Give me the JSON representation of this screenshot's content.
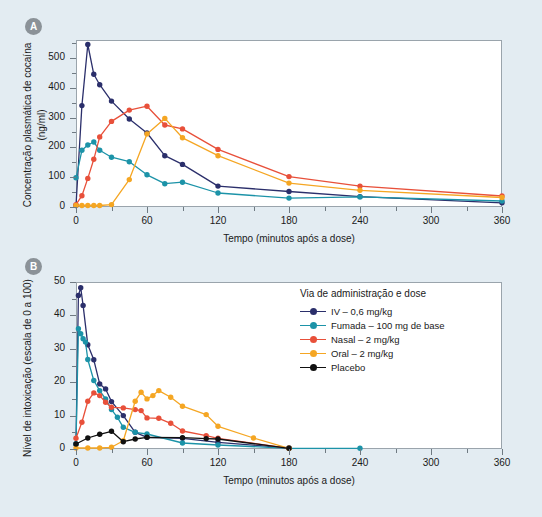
{
  "figure": {
    "background_color": "#e3ecf2"
  },
  "panels": [
    {
      "badge": "A",
      "ylabel_line1": "Concentração plasmática de cocaína",
      "ylabel_line2": "(ng/ml)",
      "xlabel": "Tempo (minutos após a dose)",
      "yticks": [
        "0",
        "100",
        "200",
        "300",
        "400",
        "500"
      ],
      "xticks": [
        "0",
        "60",
        "120",
        "180",
        "240",
        "300",
        "360"
      ]
    },
    {
      "badge": "B",
      "ylabel_line1": "Nível de intoxicação (escala de 0 a 100)",
      "ylabel_line2": "",
      "xlabel": "Tempo (minutos após a dose)",
      "yticks": [
        "0",
        "10",
        "20",
        "30",
        "40",
        "50"
      ],
      "xticks": [
        "0",
        "60",
        "120",
        "180",
        "240",
        "300",
        "360"
      ]
    }
  ],
  "legend": {
    "title": "Via de administração e dose",
    "entries": [
      {
        "label": "IV – 0,6 mg/kg",
        "color": "#2b2f6b"
      },
      {
        "label": "Fumada – 100 mg de base",
        "color": "#1c93a8"
      },
      {
        "label": "Nasal – 2 mg/kg",
        "color": "#e8503a"
      },
      {
        "label": "Oral – 2 mg/kg",
        "color": "#f5a623"
      },
      {
        "label": "Placebo",
        "color": "#111111"
      }
    ]
  },
  "colors": {
    "iv": "#2b2f6b",
    "smoked": "#1c93a8",
    "nasal": "#e8503a",
    "oral": "#f5a623",
    "placebo": "#111111",
    "background": "#e3ecf2",
    "axis": "#6f7a82",
    "plot_bg": "#ffffff"
  },
  "chart_data": [
    {
      "type": "line",
      "panel": "A",
      "title": "",
      "xlabel": "Tempo (minutos após a dose)",
      "ylabel": "Concentração plasmática de cocaína (ng/ml)",
      "xlim": [
        0,
        360
      ],
      "ylim": [
        0,
        560
      ],
      "xticks": [
        0,
        60,
        120,
        180,
        240,
        300,
        360
      ],
      "yticks": [
        0,
        100,
        200,
        300,
        400,
        500
      ],
      "grid": false,
      "legend_position": "none",
      "series": [
        {
          "name": "IV – 0,6 mg/kg",
          "color": "#2b2f6b",
          "points": [
            [
              0,
              5
            ],
            [
              5,
              340
            ],
            [
              10,
              545
            ],
            [
              15,
              445
            ],
            [
              20,
              410
            ],
            [
              30,
              355
            ],
            [
              45,
              295
            ],
            [
              60,
              248
            ],
            [
              75,
              172
            ],
            [
              90,
              143
            ],
            [
              120,
              70
            ],
            [
              180,
              52
            ],
            [
              240,
              35
            ],
            [
              360,
              14
            ]
          ]
        },
        {
          "name": "Fumada – 100 mg de base",
          "color": "#1c93a8",
          "points": [
            [
              0,
              98
            ],
            [
              5,
              190
            ],
            [
              10,
              208
            ],
            [
              15,
              218
            ],
            [
              20,
              190
            ],
            [
              30,
              167
            ],
            [
              45,
              152
            ],
            [
              60,
              108
            ],
            [
              75,
              78
            ],
            [
              90,
              83
            ],
            [
              120,
              47
            ],
            [
              180,
              30
            ],
            [
              240,
              34
            ],
            [
              360,
              20
            ]
          ]
        },
        {
          "name": "Nasal – 2 mg/kg",
          "color": "#e8503a",
          "points": [
            [
              0,
              8
            ],
            [
              5,
              38
            ],
            [
              10,
              96
            ],
            [
              15,
              160
            ],
            [
              20,
              235
            ],
            [
              30,
              287
            ],
            [
              45,
              325
            ],
            [
              60,
              338
            ],
            [
              75,
              275
            ],
            [
              90,
              262
            ],
            [
              120,
              193
            ],
            [
              180,
              102
            ],
            [
              240,
              70
            ],
            [
              360,
              37
            ]
          ]
        },
        {
          "name": "Oral – 2 mg/kg",
          "color": "#f5a623",
          "points": [
            [
              0,
              5
            ],
            [
              5,
              5
            ],
            [
              10,
              5
            ],
            [
              15,
              5
            ],
            [
              20,
              5
            ],
            [
              30,
              8
            ],
            [
              45,
              92
            ],
            [
              60,
              245
            ],
            [
              75,
              297
            ],
            [
              90,
              232
            ],
            [
              120,
              172
            ],
            [
              180,
              80
            ],
            [
              240,
              56
            ],
            [
              360,
              32
            ]
          ]
        }
      ]
    },
    {
      "type": "line",
      "panel": "B",
      "title": "",
      "xlabel": "Tempo (minutos após a dose)",
      "ylabel": "Nível de intoxicação (escala de 0 a 100)",
      "xlim": [
        0,
        360
      ],
      "ylim": [
        0,
        50
      ],
      "xticks": [
        0,
        60,
        120,
        180,
        240,
        300,
        360
      ],
      "yticks": [
        0,
        10,
        20,
        30,
        40,
        50
      ],
      "grid": false,
      "legend_position": "upper-right",
      "series": [
        {
          "name": "IV – 0,6 mg/kg",
          "color": "#2b2f6b",
          "points": [
            [
              0,
              1.5
            ],
            [
              2,
              46
            ],
            [
              4,
              48.3
            ],
            [
              6,
              43
            ],
            [
              10,
              31.2
            ],
            [
              15,
              26.7
            ],
            [
              20,
              19.5
            ],
            [
              25,
              18
            ],
            [
              30,
              14.2
            ],
            [
              40,
              10
            ],
            [
              50,
              5
            ],
            [
              60,
              3.5
            ],
            [
              90,
              3.2
            ],
            [
              120,
              2
            ],
            [
              180,
              0.3
            ]
          ]
        },
        {
          "name": "Fumada – 100 mg de base",
          "color": "#1c93a8",
          "points": [
            [
              0,
              1.5
            ],
            [
              2,
              36
            ],
            [
              4,
              34.5
            ],
            [
              6,
              33
            ],
            [
              8,
              32
            ],
            [
              10,
              26.8
            ],
            [
              15,
              20.5
            ],
            [
              20,
              17.5
            ],
            [
              25,
              15
            ],
            [
              30,
              11.8
            ],
            [
              35,
              9.5
            ],
            [
              40,
              6.5
            ],
            [
              50,
              5
            ],
            [
              60,
              4.5
            ],
            [
              90,
              1.8
            ],
            [
              120,
              1.2
            ],
            [
              180,
              0.2
            ],
            [
              240,
              0.2
            ]
          ]
        },
        {
          "name": "Nasal – 2 mg/kg",
          "color": "#e8503a",
          "points": [
            [
              0,
              3.2
            ],
            [
              5,
              8
            ],
            [
              10,
              14.3
            ],
            [
              15,
              16.8
            ],
            [
              20,
              16
            ],
            [
              25,
              14
            ],
            [
              30,
              12.5
            ],
            [
              40,
              12.3
            ],
            [
              50,
              11.8
            ],
            [
              55,
              11.5
            ],
            [
              60,
              9.3
            ],
            [
              70,
              9.2
            ],
            [
              80,
              7.7
            ],
            [
              90,
              5.4
            ],
            [
              110,
              4
            ],
            [
              120,
              3.2
            ],
            [
              180,
              0.2
            ]
          ]
        },
        {
          "name": "Oral – 2 mg/kg",
          "color": "#f5a623",
          "points": [
            [
              0,
              0.3
            ],
            [
              10,
              0.3
            ],
            [
              20,
              0.3
            ],
            [
              30,
              0.5
            ],
            [
              40,
              2.5
            ],
            [
              50,
              14.3
            ],
            [
              55,
              17
            ],
            [
              60,
              15
            ],
            [
              65,
              16
            ],
            [
              70,
              17.5
            ],
            [
              80,
              15.5
            ],
            [
              90,
              12.8
            ],
            [
              110,
              10.3
            ],
            [
              120,
              6.8
            ],
            [
              150,
              3.3
            ],
            [
              180,
              0.2
            ]
          ]
        },
        {
          "name": "Placebo",
          "color": "#111111",
          "points": [
            [
              0,
              1.5
            ],
            [
              10,
              3.3
            ],
            [
              20,
              4.4
            ],
            [
              30,
              5.3
            ],
            [
              40,
              2.2
            ],
            [
              50,
              3
            ],
            [
              60,
              3.5
            ],
            [
              90,
              3.4
            ],
            [
              110,
              3.1
            ],
            [
              120,
              3
            ],
            [
              180,
              0.2
            ]
          ]
        }
      ]
    }
  ]
}
